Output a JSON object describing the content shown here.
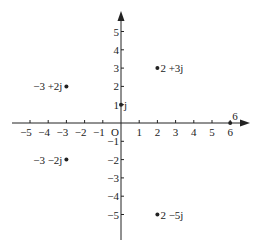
{
  "diagram": {
    "title": "",
    "type": "complex-plane (Argand diagram)",
    "origin_label": "O",
    "x_ticks": [
      "−5",
      "−4",
      "−3",
      "−2",
      "−1",
      "1",
      "2",
      "3",
      "4",
      "5",
      "6"
    ],
    "y_ticks": [
      "5",
      "4",
      "3",
      "2",
      "1",
      "−1",
      "−2",
      "−3",
      "−4",
      "−5"
    ],
    "points": [
      {
        "label": "2 +3j",
        "re": 2,
        "im": 3,
        "side": "right"
      },
      {
        "label": "−3 +2j",
        "re": -3,
        "im": 2,
        "side": "left"
      },
      {
        "label": "j",
        "re": 0,
        "im": 1,
        "side": "right"
      },
      {
        "label": "−3 −2j",
        "re": -3,
        "im": -2,
        "side": "left"
      },
      {
        "label": "2 −5j",
        "re": 2,
        "im": -5,
        "side": "right"
      },
      {
        "label": "6",
        "re": 6,
        "im": 0,
        "side": "above-right"
      }
    ],
    "colors": {
      "ink": "#222222",
      "background": "#ffffff"
    }
  }
}
